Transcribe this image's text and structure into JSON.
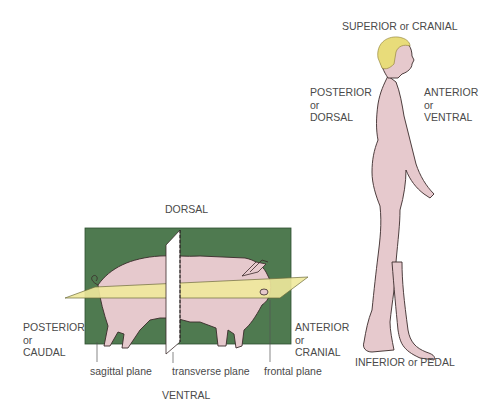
{
  "pig_diagram": {
    "directions": {
      "dorsal": "DORSAL",
      "ventral": "VENTRAL",
      "posterior": [
        "POSTERIOR",
        "or",
        "CAUDAL"
      ],
      "anterior": [
        "ANTERIOR",
        "or",
        "CRANIAL"
      ]
    },
    "planes": {
      "sagittal": "sagittal plane",
      "transverse": "transverse plane",
      "frontal": "frontal plane"
    }
  },
  "human_diagram": {
    "superior": "SUPERIOR or CRANIAL",
    "inferior": "INFERIOR or PEDAL",
    "posterior": [
      "POSTERIOR",
      "or",
      "DORSAL"
    ],
    "anterior": [
      "ANTERIOR",
      "or",
      "VENTRAL"
    ]
  },
  "colors": {
    "sagittal_plane": "#4f7a50",
    "frontal_plane": "#efe99c",
    "transverse_plane": "#ffffff",
    "skin": "#e6c9cd",
    "hair": "#e8dc7a",
    "outline": "#3a2a2a",
    "text": "#4a4a4a"
  }
}
